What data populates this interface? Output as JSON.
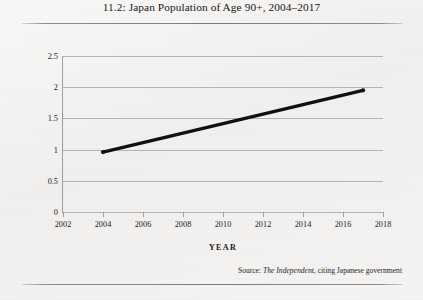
{
  "figure": {
    "title": "11.2: Japan Population of Age 90+, 2004–2017",
    "source_prefix": "Source: ",
    "source_publication": "The Independent",
    "source_suffix": ", citing Japanese government"
  },
  "chart_data": {
    "type": "line",
    "title": "11.2: Japan Population of Age 90+, 2004–2017",
    "xlabel": "YEAR",
    "ylabel": "NUMBER OF PEOPLE (IN MILLIONS)",
    "x": [
      2004,
      2017
    ],
    "values": [
      0.96,
      1.95
    ],
    "series": [
      {
        "name": "Japan population aged 90+",
        "points": [
          {
            "x": 2004,
            "y": 0.96
          },
          {
            "x": 2017,
            "y": 1.95
          }
        ]
      }
    ],
    "xlim": [
      2002,
      2018
    ],
    "ylim": [
      0,
      2.5
    ],
    "xticks": [
      2002,
      2004,
      2006,
      2008,
      2010,
      2012,
      2014,
      2016,
      2018
    ],
    "xtick_labels": [
      "2002",
      "2004",
      "2006",
      "2008",
      "2010",
      "2012",
      "2014",
      "2016",
      "2018"
    ],
    "yticks": [
      0,
      0.5,
      1,
      1.5,
      2,
      2.5
    ],
    "ytick_labels": [
      "0",
      "0.5",
      "1",
      "1.5",
      "2",
      "2.5"
    ],
    "grid": "horizontal",
    "legend": "none",
    "line_color": "#111111",
    "marker": "dot"
  }
}
